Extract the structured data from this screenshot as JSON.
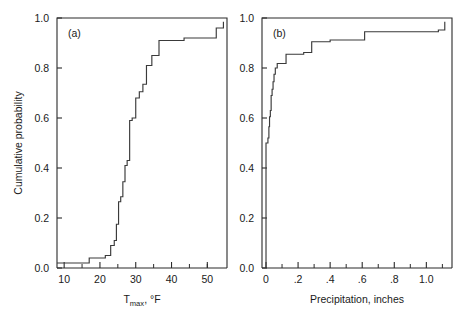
{
  "figure": {
    "width": 470,
    "height": 320,
    "background": "#ffffff",
    "line_color": "#3a3a3a",
    "axis_color": "#2b2b2b",
    "shared_ylabel": "Cumulative probability"
  },
  "panel_a": {
    "tag": "(a)",
    "xlabel_base": "T",
    "xlabel_sub": "max",
    "xlabel_tail": ", °F",
    "xlabel_full": "Tmax, °F",
    "xticklabels": [
      "10",
      "20",
      "30",
      "40",
      "50"
    ],
    "yticklabels": [
      "0.0",
      "0.2",
      "0.4",
      "0.6",
      "0.8",
      "1.0"
    ]
  },
  "panel_b": {
    "tag": "(b)",
    "xlabel_full": "Precipitation, inches",
    "xticklabels": [
      "0",
      ".2",
      ".4",
      ".6",
      ".8",
      "1.0"
    ],
    "yticklabels": [
      "0.0",
      "0.2",
      "0.4",
      "0.6",
      "0.8",
      "1.0"
    ]
  },
  "chart_data": [
    {
      "type": "line",
      "subtype": "step-post",
      "panel": "(a)",
      "title": "",
      "xlabel": "Tmax, °F",
      "ylabel": "Cumulative probability",
      "xlim": [
        8.0,
        55.5
      ],
      "ylim": [
        0.0,
        1.0
      ],
      "xticks": [
        10,
        20,
        30,
        40,
        50
      ],
      "xticks_minor": [
        15,
        25,
        35,
        45,
        50
      ],
      "yticks": [
        0.0,
        0.2,
        0.4,
        0.6,
        0.8,
        1.0
      ],
      "grid": false,
      "legend": null,
      "annotations": [
        {
          "text": "(a)",
          "x": 11.0,
          "y": 0.94
        }
      ],
      "x": [
        8.0,
        17.0,
        17.0,
        21.5,
        21.5,
        23.0,
        23.0,
        24.0,
        24.0,
        24.6,
        24.6,
        25.2,
        25.2,
        25.8,
        25.8,
        26.4,
        26.4,
        27.0,
        27.0,
        27.6,
        27.6,
        28.3,
        28.3,
        29.0,
        29.0,
        30.0,
        30.0,
        31.0,
        31.0,
        32.0,
        32.0,
        33.0,
        33.0,
        34.5,
        34.5,
        36.5,
        36.5,
        43.5,
        43.5,
        52.5,
        52.5,
        54.5,
        54.5
      ],
      "y": [
        0.02,
        0.02,
        0.04,
        0.04,
        0.05,
        0.05,
        0.09,
        0.09,
        0.11,
        0.11,
        0.175,
        0.175,
        0.265,
        0.265,
        0.285,
        0.285,
        0.345,
        0.345,
        0.41,
        0.41,
        0.43,
        0.43,
        0.59,
        0.59,
        0.6,
        0.6,
        0.68,
        0.68,
        0.705,
        0.705,
        0.735,
        0.735,
        0.81,
        0.81,
        0.85,
        0.85,
        0.91,
        0.91,
        0.92,
        0.92,
        0.96,
        0.96,
        0.985
      ]
    },
    {
      "type": "line",
      "subtype": "step-post",
      "panel": "(b)",
      "title": "",
      "xlabel": "Precipitation, inches",
      "ylabel": "Cumulative probability",
      "xlim": [
        -0.025,
        1.16
      ],
      "ylim": [
        0.0,
        1.0
      ],
      "xticks": [
        0.0,
        0.2,
        0.4,
        0.6,
        0.8,
        1.0
      ],
      "xticks_minor": [
        0.1,
        0.3,
        0.5,
        0.7,
        0.9,
        1.1
      ],
      "yticks": [
        0.0,
        0.2,
        0.4,
        0.6,
        0.8,
        1.0
      ],
      "grid": false,
      "legend": null,
      "annotations": [
        {
          "text": "(b)",
          "x": 0.045,
          "y": 0.94
        }
      ],
      "x": [
        0.0,
        0.0,
        0.012,
        0.012,
        0.018,
        0.018,
        0.022,
        0.022,
        0.027,
        0.027,
        0.032,
        0.032,
        0.038,
        0.038,
        0.044,
        0.044,
        0.05,
        0.05,
        0.058,
        0.058,
        0.07,
        0.07,
        0.125,
        0.125,
        0.235,
        0.235,
        0.285,
        0.285,
        0.4,
        0.4,
        0.615,
        0.615,
        1.075,
        1.075,
        1.115,
        1.115
      ],
      "y": [
        0.0,
        0.5,
        0.5,
        0.52,
        0.52,
        0.565,
        0.565,
        0.605,
        0.605,
        0.63,
        0.63,
        0.69,
        0.69,
        0.715,
        0.715,
        0.745,
        0.745,
        0.775,
        0.775,
        0.8,
        0.8,
        0.818,
        0.818,
        0.855,
        0.855,
        0.862,
        0.862,
        0.905,
        0.905,
        0.912,
        0.912,
        0.945,
        0.945,
        0.952,
        0.952,
        0.985
      ]
    }
  ]
}
